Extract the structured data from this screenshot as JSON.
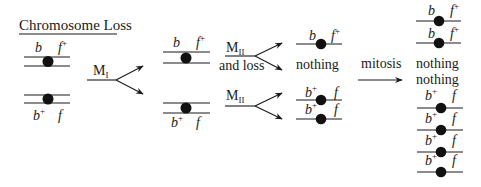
{
  "title": "Chromosome Loss",
  "colors": {
    "ink": "#1a1a1a",
    "centromere": "#111111",
    "background": "#ffffff"
  },
  "alleles": {
    "b": "b",
    "b_plus_base": "b",
    "plus": "+",
    "f": "f",
    "f_plus_base": "f"
  },
  "stage0": {
    "top_pair": {
      "left_label": "b",
      "right_label": "f",
      "right_sup": "+"
    },
    "bottom_pair": {
      "left_label": "b",
      "left_sup": "+",
      "right_label": "f"
    }
  },
  "arrow_meiosis1": {
    "label": "M",
    "sub": "I"
  },
  "stage1": {
    "top_pair": {
      "left_label": "b",
      "right_label": "f",
      "right_sup": "+"
    },
    "bottom_pair": {
      "left_label": "b",
      "left_sup": "+",
      "right_label": "f"
    }
  },
  "arrow_meiosis2_loss": {
    "label": "M",
    "sub": "II",
    "caption": "and loss"
  },
  "arrow_meiosis2": {
    "label": "M",
    "sub": "II"
  },
  "stage2": {
    "items": [
      {
        "type": "chromatid",
        "left_label": "b",
        "right_label": "f",
        "right_sup": "+"
      },
      {
        "type": "text",
        "text": "nothing"
      },
      {
        "type": "chromatid",
        "left_label": "b",
        "left_sup": "+",
        "right_label": "f"
      },
      {
        "type": "chromatid",
        "left_label": "b",
        "left_sup": "+",
        "right_label": "f"
      }
    ]
  },
  "arrow_mitosis": {
    "label": "mitosis"
  },
  "stage3": {
    "items": [
      {
        "type": "chromatid",
        "left_label": "b",
        "right_label": "f",
        "right_sup": "+"
      },
      {
        "type": "chromatid",
        "left_label": "b",
        "right_label": "f",
        "right_sup": "+"
      },
      {
        "type": "text",
        "text": "nothing"
      },
      {
        "type": "text",
        "text": "nothing"
      },
      {
        "type": "chromatid",
        "left_label": "b",
        "left_sup": "+",
        "right_label": "f"
      },
      {
        "type": "chromatid",
        "left_label": "b",
        "left_sup": "+",
        "right_label": "f"
      },
      {
        "type": "chromatid",
        "left_label": "b",
        "left_sup": "+",
        "right_label": "f"
      },
      {
        "type": "chromatid",
        "left_label": "b",
        "left_sup": "+",
        "right_label": "f"
      }
    ]
  }
}
